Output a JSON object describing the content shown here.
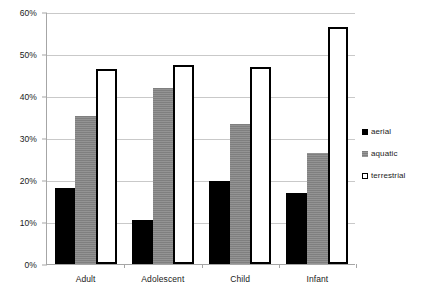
{
  "chart_data": {
    "type": "bar",
    "title": "",
    "subtitle": "",
    "xlabel": "",
    "ylabel": "",
    "categories": [
      "Adult",
      "Adolescent",
      "Child",
      "Infant"
    ],
    "series": [
      {
        "name": "aerial",
        "values": [
          18.2,
          10.4,
          19.8,
          16.8
        ],
        "color": "#000000",
        "style": "solid-black"
      },
      {
        "name": "aquatic",
        "values": [
          35.2,
          42.0,
          33.4,
          26.5
        ],
        "color": "#7f7f7f",
        "style": "gray-hatched"
      },
      {
        "name": "terrestrial",
        "values": [
          46.5,
          47.3,
          46.8,
          56.5
        ],
        "color": "#ffffff",
        "style": "white-black-outline"
      }
    ],
    "ylim": [
      0,
      60
    ],
    "ytick_values": [
      0,
      10,
      20,
      30,
      40,
      50,
      60
    ],
    "ytick_labels": [
      "0%",
      "10%",
      "20%",
      "30%",
      "40%",
      "50%",
      "60%"
    ],
    "grid": true,
    "grid_axis": "y",
    "legend_position": "right",
    "legend_entries": [
      "aerial",
      "aquatic",
      "terrestrial"
    ]
  },
  "colors": {
    "aerial": "#000000",
    "aquatic": "#7f7f7f",
    "terrestrial": "#ffffff",
    "outline": "#000000",
    "gridline": "#c9c9c9",
    "axis": "#a6a6a6",
    "text": "#1a1a1a",
    "background": "#ffffff"
  }
}
